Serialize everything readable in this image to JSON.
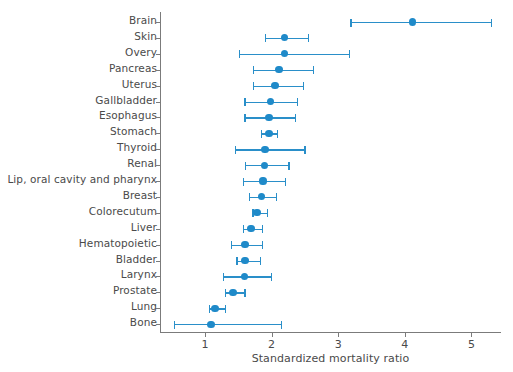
{
  "chart_data": {
    "type": "scatter",
    "subtype": "forest-plot",
    "title": "",
    "xlabel": "Standardized mortality ratio",
    "ylabel": "",
    "xlim": [
      0.4,
      5.45
    ],
    "xticks": [
      1,
      2,
      3,
      4,
      5
    ],
    "xtick_labels": [
      "1",
      "2",
      "3",
      "4",
      "5"
    ],
    "grid": false,
    "legend": null,
    "marker_color": "#1f8ac9",
    "line_color": "#2a8fc9",
    "axis_color": "#7b7b7b",
    "text_color": "#4a4a4a",
    "categories": [
      "Brain",
      "Skin",
      "Overy",
      "Pancreas",
      "Uterus",
      "Gallbladder",
      "Esophagus",
      "Stomach",
      "Thyroid",
      "Renal",
      "Lip, oral cavity and pharynx",
      "Breast",
      "Colorecutum",
      "Liver",
      "Hematopoietic",
      "Bladder",
      "Larynx",
      "Prostate",
      "Lung",
      "Bone"
    ],
    "points": [
      {
        "category": "Brain",
        "value": 4.11,
        "low": 3.18,
        "high": 5.29
      },
      {
        "category": "Skin",
        "value": 2.19,
        "low": 1.9,
        "high": 2.54
      },
      {
        "category": "Overy",
        "value": 2.19,
        "low": 1.51,
        "high": 3.16
      },
      {
        "category": "Pancreas",
        "value": 2.11,
        "low": 1.72,
        "high": 2.62
      },
      {
        "category": "Uterus",
        "value": 2.05,
        "low": 1.72,
        "high": 2.47
      },
      {
        "category": "Gallbladder",
        "value": 1.98,
        "low": 1.59,
        "high": 2.38
      },
      {
        "category": "Esophagus",
        "value": 1.96,
        "low": 1.59,
        "high": 2.35
      },
      {
        "category": "Stomach",
        "value": 1.96,
        "low": 1.84,
        "high": 2.08
      },
      {
        "category": "Thyroid",
        "value": 1.9,
        "low": 1.45,
        "high": 2.49
      },
      {
        "category": "Renal",
        "value": 1.89,
        "low": 1.6,
        "high": 2.25
      },
      {
        "category": "Lip, oral cavity and pharynx",
        "value": 1.87,
        "low": 1.57,
        "high": 2.2
      },
      {
        "category": "Breast",
        "value": 1.85,
        "low": 1.66,
        "high": 2.06
      },
      {
        "category": "Colorecutum",
        "value": 1.78,
        "low": 1.71,
        "high": 1.93
      },
      {
        "category": "Liver",
        "value": 1.69,
        "low": 1.57,
        "high": 1.85
      },
      {
        "category": "Hematopoietic",
        "value": 1.6,
        "low": 1.39,
        "high": 1.85
      },
      {
        "category": "Bladder",
        "value": 1.6,
        "low": 1.47,
        "high": 1.82
      },
      {
        "category": "Larynx",
        "value": 1.59,
        "low": 1.27,
        "high": 1.99
      },
      {
        "category": "Prostate",
        "value": 1.42,
        "low": 1.3,
        "high": 1.59
      },
      {
        "category": "Lung",
        "value": 1.15,
        "low": 1.06,
        "high": 1.3
      },
      {
        "category": "Bone",
        "value": 1.09,
        "low": 0.53,
        "high": 2.14
      }
    ]
  }
}
